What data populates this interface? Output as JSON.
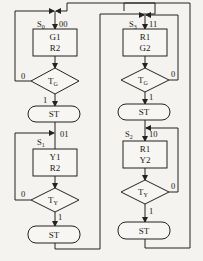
{
  "diagram": {
    "type": "ASM chart (traffic light controller)",
    "states": [
      {
        "name": "S0",
        "name_main": "S",
        "name_sub": "0",
        "code": "00",
        "outputs": [
          "G1",
          "R2"
        ],
        "condition_main": "T",
        "condition_sub": "G",
        "false_label": "0",
        "true_label": "1",
        "terminal": "ST"
      },
      {
        "name": "S1",
        "name_main": "S",
        "name_sub": "1",
        "code": "01",
        "outputs": [
          "Y1",
          "R2"
        ],
        "condition_main": "T",
        "condition_sub": "Y",
        "false_label": "0",
        "true_label": "1",
        "terminal": "ST"
      },
      {
        "name": "S3",
        "name_main": "S",
        "name_sub": "3",
        "code": "11",
        "outputs": [
          "R1",
          "G2"
        ],
        "condition_main": "T",
        "condition_sub": "G",
        "false_label": "0",
        "true_label": "1",
        "terminal": "ST"
      },
      {
        "name": "S2",
        "name_main": "S",
        "name_sub": "2",
        "code": "10",
        "outputs": [
          "R1",
          "Y2"
        ],
        "condition_main": "T",
        "condition_sub": "Y",
        "false_label": "0",
        "true_label": "1",
        "terminal": "ST"
      }
    ],
    "transitions": [
      {
        "from": "S0",
        "to": "S1",
        "via": "ST"
      },
      {
        "from": "S1",
        "to": "S3",
        "via": "ST"
      },
      {
        "from": "S3",
        "to": "S2",
        "via": "ST"
      },
      {
        "from": "S2",
        "to": "S0",
        "via": "ST"
      }
    ]
  }
}
